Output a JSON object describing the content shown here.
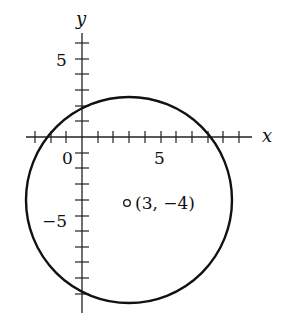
{
  "diagram": {
    "type": "circle-on-coordinate-plane",
    "axes": {
      "x_label": "x",
      "y_label": "y",
      "x_range": [
        -3,
        10
      ],
      "y_range": [
        -11,
        7
      ],
      "tick_labels": {
        "x_five": "5",
        "origin": "0",
        "y_five": "5",
        "y_neg_five": "−5"
      }
    },
    "center": {
      "x": 3,
      "y": -4,
      "label": "(3, −4)"
    },
    "radius": 6.5,
    "stroke_color": "#111111"
  }
}
